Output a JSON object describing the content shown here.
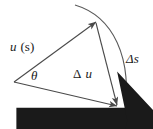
{
  "figure": {
    "background_color": "#ffffff",
    "stroke_color": "#4a4a4a",
    "text_color": "#1a1a1a"
  },
  "labels": {
    "u_at_s": {
      "vector_symbol": "u",
      "argument": "(s)"
    },
    "angle": "θ",
    "delta_u": {
      "delta": "Δ",
      "vector_symbol": "u"
    },
    "delta_s": "Δs",
    "u_at_s_plus_ds": {
      "vector_symbol": "u",
      "argument": "(s + Δs)"
    }
  },
  "geometry": {
    "origin": {
      "x": 14,
      "y": 82
    },
    "apex": {
      "x": 96,
      "y": 22
    },
    "foot": {
      "x": 117,
      "y": 106
    },
    "arc_start": {
      "x": 75,
      "y": 5
    },
    "arc_end": {
      "x": 124,
      "y": 119
    },
    "arc_control": {
      "x": 142,
      "y": 60
    }
  }
}
